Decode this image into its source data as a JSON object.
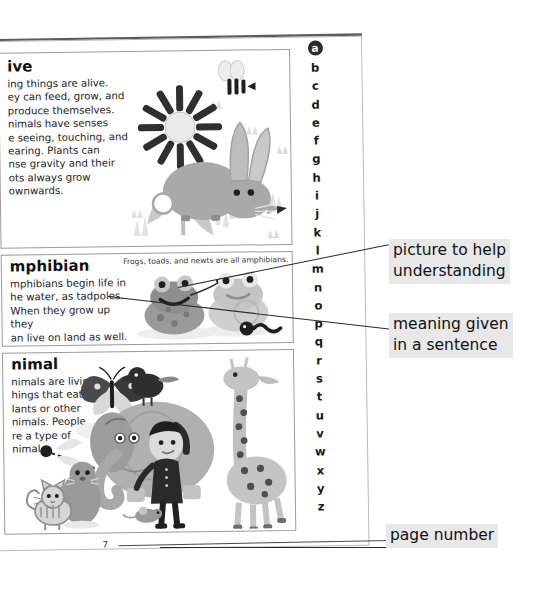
{
  "page": {
    "number": "7",
    "alphabet": [
      "a",
      "b",
      "c",
      "d",
      "e",
      "f",
      "g",
      "h",
      "i",
      "j",
      "k",
      "l",
      "m",
      "n",
      "o",
      "p",
      "q",
      "r",
      "s",
      "t",
      "u",
      "v",
      "w",
      "x",
      "y",
      "z"
    ],
    "active_letter": "a"
  },
  "entries": [
    {
      "headword": "alive",
      "headword_visible": "ive",
      "definition": "Living things are alive. They can feed, grow, and reproduce themselves. Animals have senses like seeing, touching, and hearing. Plants can sense gravity and their roots always grow downwards.",
      "definition_visible": "ing things are alive.\ney can feed, grow, and\nproduce themselves.\nnimals have senses\ne seeing, touching, and\nearing. Plants can\nnse gravity and their\nots always grow\nownwards.",
      "caption": "",
      "illustration": "sunflower-grass-bee-rabbit"
    },
    {
      "headword": "amphibian",
      "headword_visible": "mphibian",
      "definition": "Amphibians begin life in the water, as tadpoles. When they grow up they can live on land as well.",
      "definition_visible": "mphibians begin life in\nhe water, as tadpoles.\nWhen they grow up they\nan live on land as well.",
      "caption": "Frogs, toads, and newts are all amphibians.",
      "illustration": "two-frogs-tadpole"
    },
    {
      "headword": "animal",
      "headword_visible": "nimal",
      "definition": "Animals are living things that eat plants or other animals. People are a type of animal.",
      "definition_visible": "nimals are living\nhings that eat\nlants or other\nnimals. People\nre a type of\nnimal.",
      "caption": "",
      "illustration": "butterfly-dragonfly-cat-seal-elephant-bird-boy-giraffe-mouse"
    }
  ],
  "annotations": [
    {
      "id": "picture",
      "text": "picture to help\nunderstanding"
    },
    {
      "id": "meaning",
      "text": "meaning given\nin a sentence"
    },
    {
      "id": "page",
      "text": "page number"
    }
  ],
  "colors": {
    "page_background": "#ffffff",
    "ink": "#1a1a1a",
    "rule": "#9a9a9a",
    "spine": "#5b5b5b",
    "callout_highlight": "#e8e8e8",
    "art_gray_mid": "#a8a8a8",
    "art_gray_light": "#d4d4d4",
    "art_gray_dark": "#6e6e6e"
  }
}
